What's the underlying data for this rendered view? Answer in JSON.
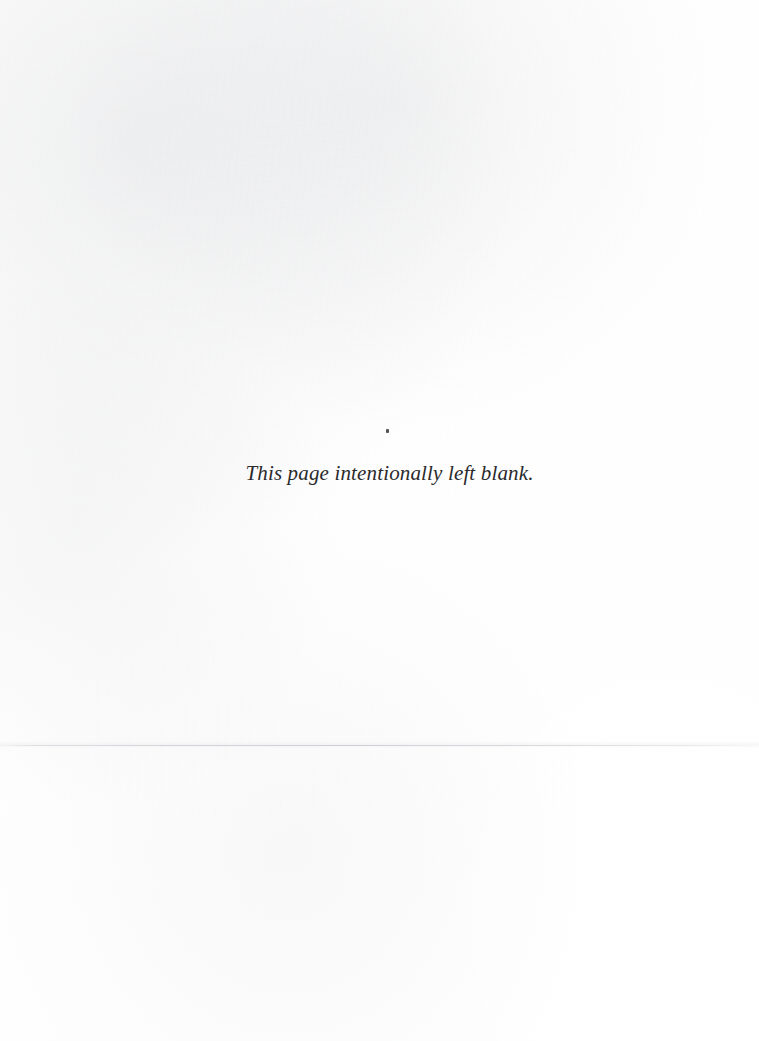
{
  "page": {
    "width": 759,
    "height": 1041,
    "background_color": "#fefefe",
    "kind": "scanned-book-page"
  },
  "notice": {
    "text": "This page intentionally left blank.",
    "style": "italic-serif",
    "text_color": "#2a2a2c",
    "align": "center"
  },
  "artifacts": {
    "speck": {
      "name": "ink-speck",
      "color": "#3b3b3d"
    },
    "seam": {
      "name": "horizontal-scan-seam",
      "color": "#c6c8ce"
    },
    "grain": {
      "name": "paper-bleed-through",
      "color": "#c2c4ca"
    }
  }
}
